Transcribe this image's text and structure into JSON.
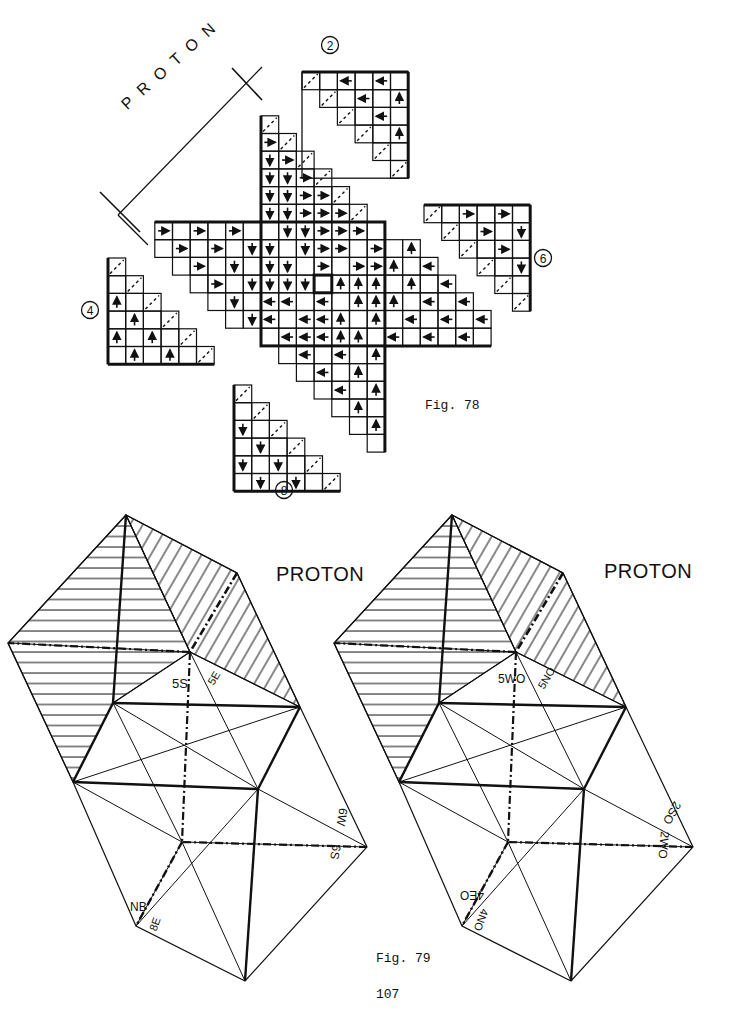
{
  "page": {
    "number": "107"
  },
  "fig78": {
    "caption": "Fig. 78",
    "proton_label": "P R O T O N",
    "circle_labels": [
      "2",
      "4",
      "6",
      "8"
    ]
  },
  "fig79": {
    "caption": "Fig. 79",
    "left": {
      "title": "PROTON",
      "labels": {
        "a": "5S",
        "b": "5E",
        "c": "6W",
        "d": "6S",
        "e": "NB",
        "f": "8E"
      }
    },
    "right": {
      "title": "PROTON",
      "labels": {
        "a": "5WO",
        "b": "5NO",
        "c": "2SO",
        "d": "2WO",
        "e": "4EO",
        "f": "4NO"
      }
    }
  }
}
